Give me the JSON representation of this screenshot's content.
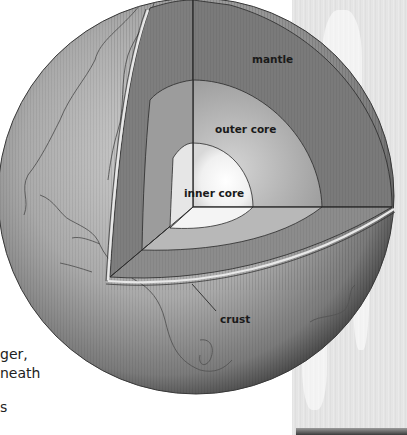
{
  "figure": {
    "labels": {
      "mantle": "mantle",
      "outer_core": "outer core",
      "inner_core": "inner core",
      "crust": "crust"
    },
    "side_text_fragments": [
      "ger,",
      "neath",
      "s"
    ],
    "colors": {
      "sphere_dark": "#4a4a4a",
      "sphere_mid": "#9a9a9a",
      "sphere_light": "#c8c8c8",
      "mantle": "#7d7d7d",
      "outer_core": "#a9a9a9",
      "inner_core": "#f2f2f2",
      "outline": "#2a2a2a",
      "background_panel": "#e4e4e4"
    }
  }
}
